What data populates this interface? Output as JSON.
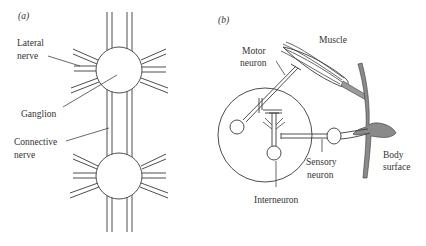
{
  "figure": {
    "panel_a": {
      "tag": "(a)",
      "labels": {
        "lateral_nerve_1": "Lateral",
        "lateral_nerve_2": "nerve",
        "ganglion": "Ganglion",
        "connective_nerve_1": "Connective",
        "connective_nerve_2": "nerve"
      }
    },
    "panel_b": {
      "tag": "(b)",
      "labels": {
        "motor_neuron_1": "Motor",
        "motor_neuron_2": "neuron",
        "muscle": "Muscle",
        "sensory_neuron_1": "Sensory",
        "sensory_neuron_2": "neuron",
        "interneuron": "Interneuron",
        "body_surface_1": "Body",
        "body_surface_2": "surface"
      }
    },
    "colors": {
      "line": "#3a3a3a",
      "body_surface_fill": "#8a8a8a",
      "background": "#ffffff"
    }
  }
}
